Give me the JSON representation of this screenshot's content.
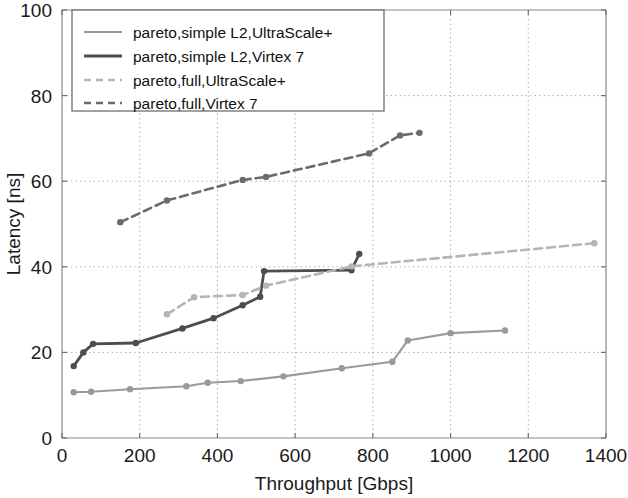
{
  "chart_data": {
    "type": "line",
    "title": "",
    "xlabel": "Throughput [Gbps]",
    "ylabel": "Latency [ns]",
    "xlim": [
      0,
      1400
    ],
    "ylim": [
      0,
      100
    ],
    "xticks": [
      0,
      200,
      400,
      600,
      800,
      1000,
      1200,
      1400
    ],
    "yticks": [
      0,
      20,
      40,
      60,
      80,
      100
    ],
    "grid": true,
    "grid_style": "dotted",
    "legend_position": "upper-left",
    "series": [
      {
        "name": "pareto,simple L2,UltraScale+",
        "color": "#9a9a9a",
        "linestyle": "solid",
        "marker": "circle",
        "x": [
          30,
          75,
          175,
          320,
          375,
          460,
          570,
          720,
          850,
          890,
          1000,
          1140
        ],
        "y": [
          10.7,
          10.8,
          11.4,
          12.1,
          12.9,
          13.3,
          14.4,
          16.3,
          17.8,
          22.8,
          24.5,
          25.1
        ]
      },
      {
        "name": "pareto,simple L2,Virtex 7",
        "color": "#4d4d4d",
        "linestyle": "solid",
        "marker": "circle",
        "x": [
          30,
          55,
          80,
          190,
          310,
          390,
          465,
          510,
          520,
          745,
          765
        ],
        "y": [
          16.8,
          20.0,
          22.0,
          22.2,
          25.6,
          28.0,
          31.0,
          33.0,
          39.0,
          39.2,
          43.0
        ]
      },
      {
        "name": "pareto,full,UltraScale+",
        "color": "#b5b5b5",
        "linestyle": "dashed",
        "marker": "circle",
        "x": [
          270,
          340,
          465,
          525,
          745,
          1370
        ],
        "y": [
          28.9,
          32.9,
          33.4,
          35.6,
          40.1,
          45.5
        ]
      },
      {
        "name": "pareto,full,Virtex 7",
        "color": "#6b6b6b",
        "linestyle": "dashed",
        "marker": "circle",
        "x": [
          150,
          270,
          465,
          525,
          790,
          870,
          920
        ],
        "y": [
          50.4,
          55.5,
          60.3,
          61.0,
          66.5,
          70.7,
          71.3
        ]
      }
    ]
  },
  "legend": {
    "items": [
      {
        "label": "pareto,simple L2,UltraScale+"
      },
      {
        "label": "pareto,simple L2,Virtex 7"
      },
      {
        "label": "pareto,full,UltraScale+"
      },
      {
        "label": "pareto,full,Virtex 7"
      }
    ]
  },
  "axes": {
    "x_label": "Throughput [Gbps]",
    "y_label": "Latency [ns]",
    "x_ticks": [
      "0",
      "200",
      "400",
      "600",
      "800",
      "1000",
      "1200",
      "1400"
    ],
    "y_ticks": [
      "0",
      "20",
      "40",
      "60",
      "80",
      "100"
    ]
  },
  "colors": {
    "frame": "#7a7a7a",
    "grid": "#b0b0b0",
    "text": "#1a1a1a",
    "series_light_solid": "#9a9a9a",
    "series_dark_solid": "#4d4d4d",
    "series_light_dashed": "#b5b5b5",
    "series_dark_dashed": "#6b6b6b"
  }
}
